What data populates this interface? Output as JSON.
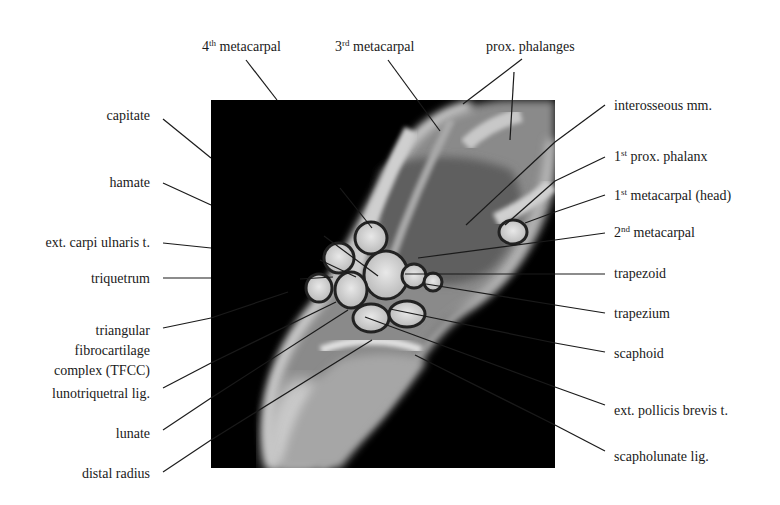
{
  "figure": {
    "type": "annotated MRI of wrist (coronal)",
    "image_box": {
      "x": 211,
      "y": 100,
      "width": 344,
      "height": 368
    },
    "colors": {
      "background": "#ffffff",
      "image_bg": "#000000",
      "leader_line": "#1a1a1a",
      "text": "#1a1a1a"
    }
  },
  "labels": {
    "top": [
      {
        "id": "4th-metacarpal",
        "num": "4",
        "sup": "th",
        "text": " metacarpal"
      },
      {
        "id": "3rd-metacarpal",
        "num": "3",
        "sup": "rd",
        "text": " metacarpal"
      },
      {
        "id": "prox-phalanges",
        "text": "prox. phalanges"
      }
    ],
    "left": [
      {
        "id": "capitate",
        "text": "capitate"
      },
      {
        "id": "hamate",
        "text": "hamate"
      },
      {
        "id": "ext-carpi-ulnaris",
        "text": "ext. carpi ulnaris t."
      },
      {
        "id": "triquetrum",
        "text": "triquetrum"
      },
      {
        "id": "tfcc",
        "text": "triangular fibrocartilage complex (TFCC)"
      },
      {
        "id": "lunotriquetral-lig",
        "text": "lunotriquetral lig."
      },
      {
        "id": "lunate",
        "text": "lunate"
      },
      {
        "id": "distal-radius",
        "text": "distal radius"
      }
    ],
    "right": [
      {
        "id": "interosseous",
        "text": "interosseous mm."
      },
      {
        "id": "1st-prox-phalanx",
        "num": "1",
        "sup": "st",
        "text": " prox. phalanx"
      },
      {
        "id": "1st-metacarpal-head",
        "num": "1",
        "sup": "st",
        "text": " metacarpal (head)"
      },
      {
        "id": "2nd-metacarpal",
        "num": "2",
        "sup": "nd",
        "text": " metacarpal"
      },
      {
        "id": "trapezoid",
        "text": "trapezoid"
      },
      {
        "id": "trapezium",
        "text": "trapezium"
      },
      {
        "id": "scaphoid",
        "text": "scaphoid"
      },
      {
        "id": "ext-pollicis-brevis",
        "text": "ext. pollicis brevis t."
      },
      {
        "id": "scapholunate-lig",
        "text": "scapholunate lig."
      }
    ]
  }
}
